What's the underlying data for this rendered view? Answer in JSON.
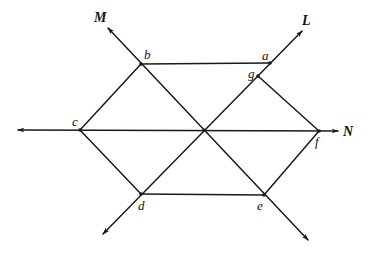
{
  "diagram": {
    "lines": [
      {
        "name": "L",
        "label": "L"
      },
      {
        "name": "M",
        "label": "M"
      },
      {
        "name": "N",
        "label": "N"
      }
    ],
    "points": {
      "a": "a",
      "b": "b",
      "c": "c",
      "d": "d",
      "e": "e",
      "f": "f",
      "g": "g"
    },
    "segments": [
      "b-a",
      "b-c",
      "c-d",
      "d-e",
      "e-f",
      "f-g"
    ],
    "colors": {
      "stroke": "#1a1a1a",
      "background": "#ffffff"
    }
  }
}
